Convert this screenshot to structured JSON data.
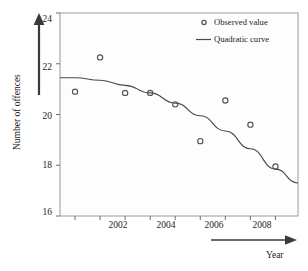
{
  "chart_data": {
    "type": "scatter",
    "title": "",
    "xlabel": "Year",
    "ylabel": "Number of offences",
    "xlim": [
      2000.4,
      2009.9
    ],
    "ylim": [
      16,
      24
    ],
    "xticks": [
      2002,
      2004,
      2006,
      2008
    ],
    "xtick_labels": [
      "2002",
      "2004",
      "2006",
      "2008"
    ],
    "yticks": [
      16,
      18,
      20,
      22,
      24
    ],
    "ytick_labels": [
      "16",
      "18",
      "20",
      "22",
      "24"
    ],
    "grid": false,
    "legend_position": "top-right",
    "series": [
      {
        "name": "Observed value",
        "type": "scatter",
        "marker": "open-circle",
        "color": "#555555",
        "x": [
          2001,
          2002,
          2003,
          2004,
          2005,
          2006,
          2007,
          2008,
          2009
        ],
        "values": [
          20.9,
          22.25,
          20.85,
          20.85,
          20.4,
          18.95,
          20.55,
          19.6,
          17.95
        ]
      },
      {
        "name": "Quadratic curve",
        "type": "line",
        "color": "#4a4a4a",
        "x": [
          2000.4,
          2001,
          2002,
          2003,
          2004,
          2005,
          2006,
          2007,
          2008,
          2009,
          2009.9
        ],
        "values": [
          21.45,
          21.45,
          21.35,
          21.15,
          20.85,
          20.45,
          19.95,
          19.35,
          18.65,
          17.85,
          17.3
        ]
      }
    ]
  },
  "axes": {
    "y_axis_title": "Number of offences",
    "x_axis_title": "Year"
  },
  "legend": {
    "items": [
      {
        "label": "Observed value",
        "marker": "open-circle"
      },
      {
        "label": "Quadratic curve",
        "marker": "line-segment"
      }
    ]
  },
  "ticks": {
    "y": [
      "24",
      "22",
      "20",
      "18",
      "16"
    ],
    "x": [
      "2002",
      "2004",
      "2006",
      "2008"
    ]
  },
  "colors": {
    "curve": "#4a4a4a",
    "marker": "#555555",
    "frame": "#9a9a9a",
    "text": "#242424",
    "plot_bg": "#fdfdfd"
  }
}
